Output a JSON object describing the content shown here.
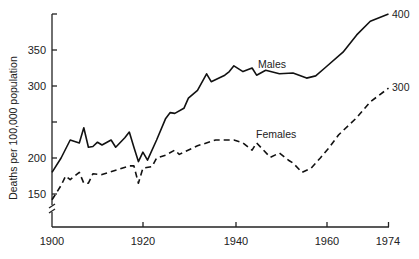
{
  "chart_data": {
    "type": "line",
    "title": "",
    "xlabel": "",
    "ylabel": "Deaths per 100,000 population",
    "xlim": [
      1900,
      1974
    ],
    "ylim": [
      130,
      400
    ],
    "x_ticks": [
      1900,
      1920,
      1940,
      1960,
      1974
    ],
    "y_ticks": [
      150,
      200,
      250,
      300,
      350,
      400
    ],
    "y_tick_labels": [
      "150",
      "200",
      "",
      "300",
      "350",
      ""
    ],
    "y_axis_break": true,
    "grid": false,
    "legend": "inline labels",
    "series": [
      {
        "name": "Males",
        "style": "solid",
        "end_label": "400",
        "x": [
          1900,
          1902,
          1904,
          1906,
          1907,
          1908,
          1909,
          1910,
          1911,
          1913,
          1914,
          1916,
          1917,
          1918,
          1919,
          1920,
          1921,
          1923,
          1925,
          1926,
          1927,
          1929,
          1930,
          1932,
          1934,
          1935,
          1938,
          1939,
          1940,
          1942,
          1944,
          1945,
          1947,
          1950,
          1953,
          1956,
          1958,
          1960,
          1964,
          1967,
          1970,
          1974
        ],
        "values": [
          180,
          200,
          225,
          221,
          242,
          215,
          216,
          222,
          218,
          225,
          215,
          228,
          236,
          215,
          195,
          208,
          197,
          225,
          255,
          263,
          262,
          269,
          283,
          294,
          317,
          306,
          315,
          320,
          328,
          320,
          325,
          315,
          322,
          317,
          318,
          311,
          314,
          325,
          347,
          371,
          390,
          400
        ]
      },
      {
        "name": "Females",
        "style": "dashed",
        "end_label": "300",
        "x": [
          1900,
          1902,
          1903,
          1904,
          1906,
          1907,
          1908,
          1909,
          1911,
          1914,
          1917,
          1918,
          1919,
          1920,
          1922,
          1923,
          1925,
          1927,
          1928,
          1929,
          1932,
          1936,
          1940,
          1942,
          1944,
          1945,
          1948,
          1950,
          1952,
          1953,
          1955,
          1957,
          1959,
          1961,
          1963,
          1967,
          1970,
          1974
        ],
        "values": [
          142,
          162,
          175,
          170,
          180,
          165,
          165,
          178,
          177,
          183,
          189,
          189,
          165,
          186,
          188,
          200,
          204,
          211,
          205,
          208,
          217,
          225,
          225,
          221,
          211,
          221,
          201,
          207,
          197,
          193,
          180,
          186,
          200,
          215,
          232,
          256,
          278,
          297
        ]
      }
    ],
    "annotations": [
      "Males",
      "Females",
      "400",
      "300"
    ]
  },
  "axes": {
    "ylabel": "Deaths per 100,000 population",
    "x_tick_labels": [
      "1900",
      "1920",
      "1940",
      "1960",
      "1974"
    ],
    "y_tick_labels": [
      "350",
      "300",
      "200",
      "150"
    ]
  },
  "labels": {
    "males": "Males",
    "females": "Females",
    "males_end": "400",
    "females_end": "300"
  }
}
